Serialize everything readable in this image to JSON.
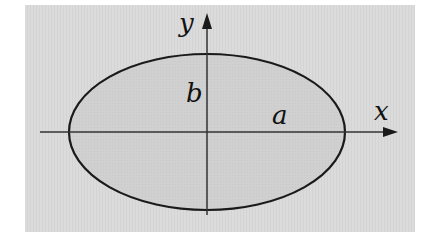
{
  "diagram": {
    "type": "ellipse-on-axes",
    "colors": {
      "panel": "#dadada",
      "ellipse_fill": "#cfcfcf",
      "stroke": "#1a1a1a",
      "axis": "#333333",
      "page": "#ffffff"
    },
    "panel": {
      "x": 25,
      "y": 5,
      "width": 390,
      "height": 227
    },
    "ellipse": {
      "cx": 207,
      "cy": 132,
      "rx": 138,
      "ry": 78
    },
    "axes": {
      "x_axis": {
        "y": 132,
        "x_start": 40,
        "x_end": 398,
        "label": "x"
      },
      "y_axis": {
        "x": 207,
        "y_start": 215,
        "y_end": 14,
        "label": "y"
      }
    },
    "labels": {
      "semi_major": "a",
      "semi_minor": "b",
      "x_axis": "x",
      "y_axis": "y"
    }
  }
}
